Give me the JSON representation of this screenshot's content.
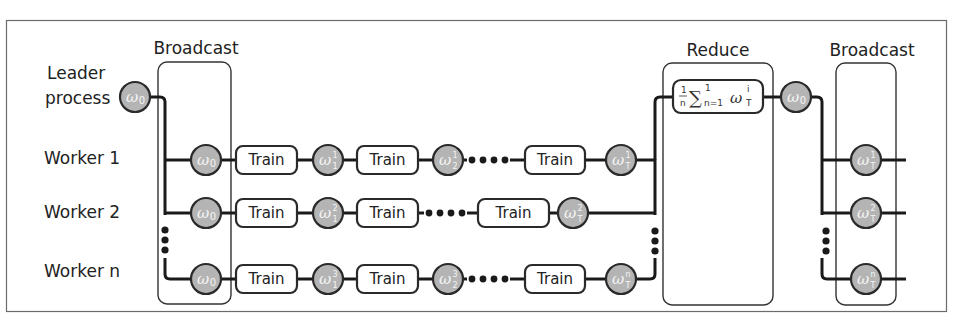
{
  "groups": {
    "broadcast_1": "Broadcast",
    "reduce": "Reduce",
    "broadcast_2": "Broadcast"
  },
  "rows": [
    {
      "label": "Leader",
      "label2": "process",
      "role": "leader"
    },
    {
      "label": "Worker 1",
      "role": "worker"
    },
    {
      "label": "Worker 2",
      "role": "worker"
    },
    {
      "label": "Worker n",
      "role": "worker"
    }
  ],
  "process_label": "Train",
  "reduce_formula": {
    "fraction_num": "1",
    "fraction_den": "n",
    "sum_symbol": "∑",
    "sum_upper": "1",
    "sum_lower": "n=1",
    "term": "ω",
    "term_sup": "i",
    "term_sub": "T"
  },
  "nodes": {
    "leader_weights": {
      "sym": "ω",
      "sub": "0"
    },
    "leader_result": {
      "sym": "ω",
      "sub": "0"
    },
    "w1": [
      {
        "sym": "ω",
        "sub": "0"
      },
      {
        "sym": "ω",
        "sup": "1",
        "sub": "1"
      },
      {
        "sym": "ω",
        "sup": "1",
        "sub": "2"
      },
      {
        "sym": "ω",
        "sup": "1",
        "sub": "T"
      }
    ],
    "w2": [
      {
        "sym": "ω",
        "sub": "0"
      },
      {
        "sym": "ω",
        "sup": "2",
        "sub": "1"
      },
      {
        "sym": "ω",
        "sup": "2",
        "sub": "T"
      }
    ],
    "wn": [
      {
        "sym": "ω",
        "sub": "0"
      },
      {
        "sym": "ω",
        "sup": "3",
        "sub": "1"
      },
      {
        "sym": "ω",
        "sup": "3",
        "sub": "2"
      },
      {
        "sym": "ω",
        "sup": "n",
        "sub": "T"
      }
    ],
    "final": [
      {
        "sym": "ω",
        "sup": "1",
        "sub": "T"
      },
      {
        "sym": "ω",
        "sup": "2",
        "sub": "T"
      },
      {
        "sym": "ω",
        "sup": "n",
        "sub": "T"
      }
    ]
  },
  "ellipsis": "•••"
}
